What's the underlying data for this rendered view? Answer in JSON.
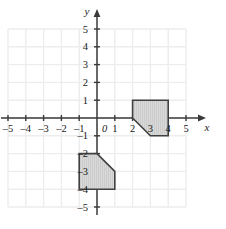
{
  "figure": {
    "kind": "coordinate-plane",
    "background_color": "#ffffff",
    "grid_color": "#ededed",
    "axis_color": "#3a3a3a",
    "shape_fill_color": "#d6d6d6",
    "shape_stroke_color": "#404040",
    "hatch_color": "#bfbfbf"
  },
  "axes": {
    "x_axis_label": "x",
    "y_axis_label": "y",
    "origin_label": "0",
    "x_min": -5,
    "x_max": 5,
    "y_min": -5,
    "y_max": 5,
    "x_ticks": [
      "–5",
      "–4",
      "–3",
      "–2",
      "–1",
      "1",
      "2",
      "3",
      "4",
      "5"
    ],
    "x_tick_values": [
      -5,
      -4,
      -3,
      -2,
      -1,
      1,
      2,
      3,
      4,
      5
    ],
    "y_ticks": [
      "5",
      "4",
      "3",
      "2",
      "1",
      "–1",
      "–2",
      "–3",
      "–4",
      "–5"
    ],
    "y_tick_values": [
      5,
      4,
      3,
      2,
      1,
      -1,
      -2,
      -3,
      -4,
      -5
    ],
    "grid_visible": true,
    "x_arrow": true,
    "y_arrow": true
  },
  "chart_data": {
    "type": "scatter",
    "title": "",
    "xlabel": "x",
    "ylabel": "y",
    "xlim": [
      -5,
      5
    ],
    "ylim": [
      -5,
      5
    ],
    "grid": true,
    "legend": "none",
    "shapes": [
      {
        "name": "upper-right-pentagon",
        "vertices": [
          [
            2,
            1
          ],
          [
            4,
            1
          ],
          [
            4,
            -1
          ],
          [
            3,
            -1
          ],
          [
            2,
            0
          ]
        ],
        "fill": "#d6d6d6",
        "stroke": "#404040"
      },
      {
        "name": "lower-left-pentagon",
        "vertices": [
          [
            -1,
            -2
          ],
          [
            0,
            -2
          ],
          [
            1,
            -3
          ],
          [
            1,
            -4
          ],
          [
            -1,
            -4
          ]
        ],
        "fill": "#d6d6d6",
        "stroke": "#404040"
      }
    ]
  }
}
